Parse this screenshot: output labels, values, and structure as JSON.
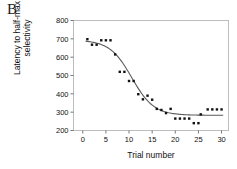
{
  "panel": {
    "label": "B"
  },
  "chart_data": {
    "type": "scatter",
    "title": "",
    "subtitle": "",
    "xlabel": "Trial number",
    "ylabel": "Latency to half-max\nselectivity",
    "ylabel_lines": [
      "Latency to half-max",
      "selectivity"
    ],
    "xlim": [
      -2,
      31.5
    ],
    "ylim": [
      200,
      800
    ],
    "xticks": [
      0,
      5,
      10,
      15,
      20,
      25,
      30
    ],
    "yticks": [
      200,
      300,
      400,
      500,
      600,
      700,
      800
    ],
    "xtick_labels": [
      "0",
      "5",
      "10",
      "15",
      "20",
      "25",
      "30"
    ],
    "ytick_labels": [
      "200",
      "300",
      "400",
      "500",
      "600",
      "700",
      "800"
    ],
    "grid": false,
    "legend": null,
    "marker": "filled-square",
    "marker_color": "#111111",
    "fit_curve_color": "#555555",
    "fit_curve_type": "sigmoid",
    "fit_params": {
      "top": 693,
      "bottom": 283,
      "inflection_x": 10.6,
      "slope": 0.42
    },
    "points": [
      {
        "x": 1,
        "y": 698
      },
      {
        "x": 2,
        "y": 668
      },
      {
        "x": 3,
        "y": 668
      },
      {
        "x": 4,
        "y": 692
      },
      {
        "x": 5,
        "y": 692
      },
      {
        "x": 6,
        "y": 692
      },
      {
        "x": 7,
        "y": 615
      },
      {
        "x": 8,
        "y": 520
      },
      {
        "x": 9,
        "y": 520
      },
      {
        "x": 10,
        "y": 470
      },
      {
        "x": 11,
        "y": 470
      },
      {
        "x": 12,
        "y": 398
      },
      {
        "x": 13,
        "y": 370
      },
      {
        "x": 14,
        "y": 390
      },
      {
        "x": 15,
        "y": 368
      },
      {
        "x": 16,
        "y": 318
      },
      {
        "x": 17,
        "y": 312
      },
      {
        "x": 18,
        "y": 295
      },
      {
        "x": 19,
        "y": 318
      },
      {
        "x": 20,
        "y": 265
      },
      {
        "x": 21,
        "y": 265
      },
      {
        "x": 22,
        "y": 265
      },
      {
        "x": 23,
        "y": 265
      },
      {
        "x": 24,
        "y": 240
      },
      {
        "x": 25,
        "y": 240
      },
      {
        "x": 25.5,
        "y": 288
      },
      {
        "x": 27,
        "y": 315
      },
      {
        "x": 28,
        "y": 315
      },
      {
        "x": 29,
        "y": 315
      },
      {
        "x": 30,
        "y": 315
      }
    ]
  },
  "axes": {
    "frame_color": "#b9b9b9",
    "tick_color": "#777777"
  }
}
